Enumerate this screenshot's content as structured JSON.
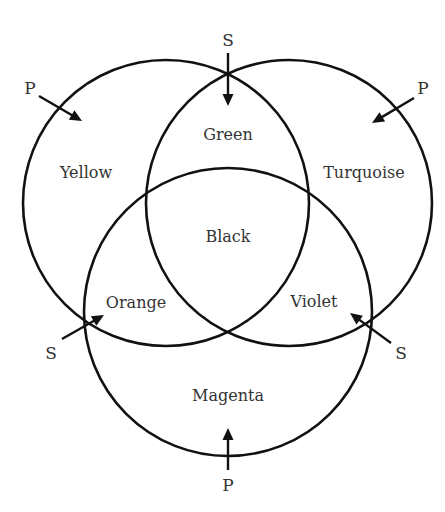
{
  "diagram": {
    "type": "venn",
    "colors": {
      "stroke": "#111111",
      "text": "#333333",
      "background": "#ffffff"
    },
    "circles": [
      {
        "id": "left",
        "cx": 166,
        "cy": 203,
        "r": 143
      },
      {
        "id": "right",
        "cx": 289,
        "cy": 203,
        "r": 143
      },
      {
        "id": "bottom",
        "cx": 228,
        "cy": 312,
        "r": 144
      }
    ],
    "regions": [
      {
        "id": "yellow",
        "label": "Yellow",
        "x": 86,
        "y": 178
      },
      {
        "id": "turquoise",
        "label": "Turquoise",
        "x": 364,
        "y": 178
      },
      {
        "id": "magenta",
        "label": "Magenta",
        "x": 228,
        "y": 401
      },
      {
        "id": "green",
        "label": "Green",
        "x": 228,
        "y": 140
      },
      {
        "id": "orange",
        "label": "Orange",
        "x": 136,
        "y": 308
      },
      {
        "id": "violet",
        "label": "Violet",
        "x": 314,
        "y": 307
      },
      {
        "id": "black",
        "label": "Black",
        "x": 228,
        "y": 242
      }
    ],
    "markers": [
      {
        "id": "p-top-left",
        "label": "P",
        "lx": 30,
        "ly": 94,
        "x1": 39,
        "y1": 96,
        "x2": 82,
        "y2": 121
      },
      {
        "id": "p-top-right",
        "label": "P",
        "lx": 423,
        "ly": 94,
        "x1": 414,
        "y1": 98,
        "x2": 372,
        "y2": 123
      },
      {
        "id": "s-top",
        "label": "S",
        "lx": 228,
        "ly": 46,
        "x1": 228,
        "y1": 53,
        "x2": 228,
        "y2": 106
      },
      {
        "id": "s-bottom-left",
        "label": "S",
        "lx": 51,
        "ly": 359,
        "x1": 62,
        "y1": 339,
        "x2": 104,
        "y2": 315
      },
      {
        "id": "s-bottom-right",
        "label": "S",
        "lx": 401,
        "ly": 359,
        "x1": 391,
        "y1": 343,
        "x2": 350,
        "y2": 313
      },
      {
        "id": "p-bottom",
        "label": "P",
        "lx": 228,
        "ly": 491,
        "x1": 228,
        "y1": 470,
        "x2": 228,
        "y2": 428
      }
    ]
  }
}
